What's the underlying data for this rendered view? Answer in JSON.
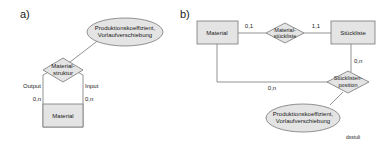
{
  "panel_a": {
    "label": "a)",
    "attribute": {
      "line1": "Produktionskoeffizient,",
      "line2": "Vorlaufverschiebung"
    },
    "relationship": {
      "line1": "Material-",
      "line2": "struktur"
    },
    "entity": "Material",
    "left_role": "Output",
    "right_role": "Input",
    "left_card": "0,n",
    "right_card": "0,n"
  },
  "panel_b": {
    "label": "b)",
    "entity_material": "Material",
    "entity_stueckliste": "Stückliste",
    "rel_materialstueckliste": {
      "line1": "Material-",
      "line2": "stückliste"
    },
    "rel_stuecklistenposition": {
      "line1": "Stücklisten-",
      "line2": "position"
    },
    "attribute": {
      "line1": "Produktionskoeffizient,",
      "line2": "Vorlaufverschiebung"
    },
    "card_material_rel": "0,1",
    "card_rel_stueckliste": "1,1",
    "card_stueckliste_pos": "0,n",
    "card_material_pos": "0,n"
  },
  "footer": {
    "code": "dsstuli"
  },
  "colors": {
    "fill": "#e4e4e4",
    "stroke": "#777777",
    "text": "#222222"
  }
}
